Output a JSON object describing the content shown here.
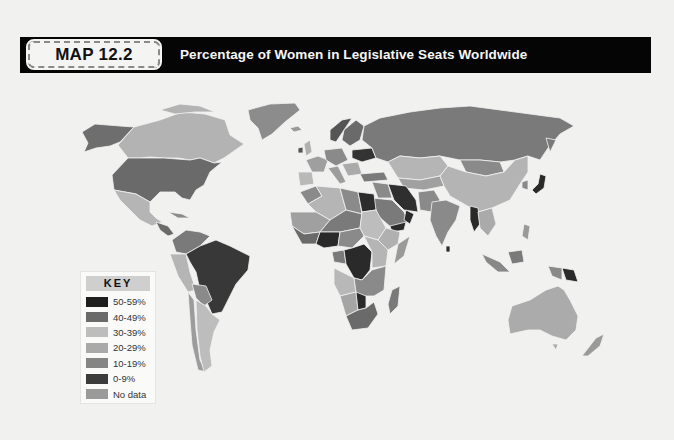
{
  "header": {
    "badge": "MAP 12.2",
    "title": "Percentage of Women in Legislative Seats Worldwide"
  },
  "key": {
    "title": "KEY",
    "items": [
      {
        "label": "50-59%",
        "color": "#1e1e1e"
      },
      {
        "label": "40-49%",
        "color": "#6a6a6a"
      },
      {
        "label": "30-39%",
        "color": "#bdbdbd"
      },
      {
        "label": "20-29%",
        "color": "#a9a9a9"
      },
      {
        "label": "10-19%",
        "color": "#858585"
      },
      {
        "label": "0-9%",
        "color": "#3c3c3c"
      },
      {
        "label": "No data",
        "color": "#9a9a9a"
      }
    ]
  },
  "map": {
    "type": "choropleth",
    "subject": "Percentage of women in legislative seats by country",
    "palette": "grayscale",
    "regions": [
      {
        "name": "Canada",
        "category": "30-39%"
      },
      {
        "name": "United States",
        "category": "10-19%"
      },
      {
        "name": "Alaska (US)",
        "category": "10-19%"
      },
      {
        "name": "Greenland",
        "category": "No data"
      },
      {
        "name": "Mexico",
        "category": "30-39%"
      },
      {
        "name": "Brazil",
        "category": "0-9%"
      },
      {
        "name": "Argentina",
        "category": "30-39%"
      },
      {
        "name": "Russia",
        "category": "10-19%"
      },
      {
        "name": "China",
        "category": "20-29%"
      },
      {
        "name": "Kazakhstan",
        "category": "30-39%"
      },
      {
        "name": "Mongolia",
        "category": "10-19%"
      },
      {
        "name": "India",
        "category": "10-19%"
      },
      {
        "name": "Iran",
        "category": "0-9%"
      },
      {
        "name": "Japan",
        "category": "0-9%"
      },
      {
        "name": "Australia",
        "category": "20-29%"
      },
      {
        "name": "Algeria",
        "category": "30-39%"
      },
      {
        "name": "Egypt",
        "category": "0-9%"
      },
      {
        "name": "DR Congo",
        "category": "0-9%"
      },
      {
        "name": "Nigeria",
        "category": "0-9%"
      },
      {
        "name": "South Africa",
        "category": "40-49%"
      },
      {
        "name": "Madagascar",
        "category": "10-19%"
      },
      {
        "name": "Papua New Guinea",
        "category": "0-9%"
      }
    ]
  }
}
